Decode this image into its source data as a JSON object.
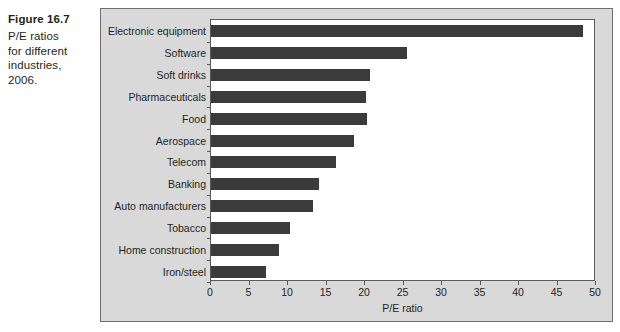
{
  "caption": {
    "figure_number": "Figure 16.7",
    "description": "P/E ratios\nfor different\nindustries, 2006."
  },
  "chart_data": {
    "type": "bar",
    "orientation": "horizontal",
    "title": "",
    "xlabel": "P/E ratio",
    "ylabel": "",
    "xlim": [
      0,
      50
    ],
    "xticks": [
      0,
      5,
      10,
      15,
      20,
      25,
      30,
      35,
      40,
      45,
      50
    ],
    "grid": false,
    "legend": null,
    "bar_color": "#3b3b3b",
    "plot_background": "#ffffff",
    "panel_background": "#d9d9d9",
    "categories": [
      "Electronic equipment",
      "Software",
      "Soft drinks",
      "Pharmaceuticals",
      "Food",
      "Aerospace",
      "Telecom",
      "Banking",
      "Auto manufacturers",
      "Tobacco",
      "Home construction",
      "Iron/steel"
    ],
    "values": [
      48.3,
      25.4,
      20.6,
      20.1,
      20.2,
      18.6,
      16.2,
      14.0,
      13.3,
      10.3,
      8.8,
      7.2
    ]
  }
}
